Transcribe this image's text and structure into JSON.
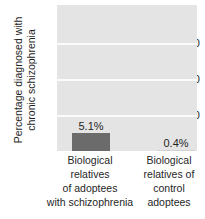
{
  "chart_data": {
    "type": "bar",
    "title": "",
    "xlabel": "",
    "ylabel": "Percentage diagnosed with chronic schizophrenia",
    "ylabel_lines": [
      "Percentage diagnosed with",
      "chronic schizophrenia"
    ],
    "categories": [
      "Biological relatives of adoptees with schizophrenia",
      "Biological relatives of control adoptees"
    ],
    "category_lines": [
      [
        "Biological",
        "relatives",
        "of adoptees",
        "with schizophrenia"
      ],
      [
        "Biological",
        "relatives of",
        "control",
        "adoptees"
      ]
    ],
    "values": [
      5.1,
      0.4
    ],
    "value_labels": [
      "5.1%",
      "0.4%"
    ],
    "ylim": [
      0,
      40.5
    ],
    "yticks": [
      10,
      20,
      30
    ],
    "ytick_labels": [
      "30",
      "20",
      "10"
    ],
    "grid": true,
    "legend": "none",
    "colors": {
      "bar": "#6b6b6b",
      "plot_background": "#e4e4e4",
      "gridline": "#fbfbfb",
      "text": "#1f1f1f",
      "figure_background": "#ffffff"
    }
  }
}
